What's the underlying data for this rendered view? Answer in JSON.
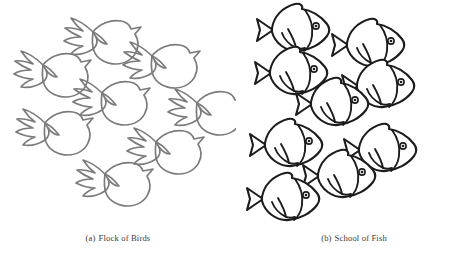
{
  "figure": {
    "background_color": "#ffffff",
    "width": 472,
    "height": 262
  },
  "panels": [
    {
      "id": "birds",
      "caption_label": "(a)",
      "caption_text": "Flock of Birds",
      "caption_full": "(a)  Flock of Birds",
      "subject": "bird",
      "subject_plural": "birds",
      "count": 8,
      "outline_color": "#7b7b7b",
      "fill_color": "#ffffff",
      "stroke_width": 1.7,
      "facing": "right",
      "arrangement": "scattered flock",
      "shapes": [
        {
          "name": "bird-1",
          "x": 97,
          "y": 40,
          "scale": 1.0
        },
        {
          "name": "bird-2",
          "x": 47,
          "y": 73,
          "scale": 1.0
        },
        {
          "name": "bird-3",
          "x": 156,
          "y": 64,
          "scale": 1.0
        },
        {
          "name": "bird-4",
          "x": 106,
          "y": 101,
          "scale": 1.0
        },
        {
          "name": "bird-5",
          "x": 201,
          "y": 111,
          "scale": 1.0
        },
        {
          "name": "bird-6",
          "x": 49,
          "y": 131,
          "scale": 1.0
        },
        {
          "name": "bird-7",
          "x": 160,
          "y": 150,
          "scale": 1.0
        },
        {
          "name": "bird-8",
          "x": 109,
          "y": 182,
          "scale": 1.0
        }
      ]
    },
    {
      "id": "fish",
      "caption_label": "(b)",
      "caption_text": "School of Fish",
      "caption_full": "(b)  School of Fish",
      "subject": "fish",
      "subject_plural": "fish",
      "count": 10,
      "outline_color": "#1c1c1c",
      "fill_color": "#ffffff",
      "stroke_width": 2.1,
      "facing": "right",
      "arrangement": "ordered school",
      "shapes": [
        {
          "name": "fish-1",
          "x": 61,
          "y": 30,
          "scale": 1.0
        },
        {
          "name": "fish-2",
          "x": 136,
          "y": 45,
          "scale": 1.0
        },
        {
          "name": "fish-3",
          "x": 59,
          "y": 73,
          "scale": 1.0
        },
        {
          "name": "fish-4",
          "x": 146,
          "y": 86,
          "scale": 1.0
        },
        {
          "name": "fish-5",
          "x": 100,
          "y": 104,
          "scale": 1.0
        },
        {
          "name": "fish-6",
          "x": 54,
          "y": 145,
          "scale": 1.0
        },
        {
          "name": "fish-7",
          "x": 148,
          "y": 150,
          "scale": 1.0
        },
        {
          "name": "fish-8",
          "x": 107,
          "y": 176,
          "scale": 1.0
        },
        {
          "name": "fish-9",
          "x": 51,
          "y": 199,
          "scale": 1.0
        },
        {
          "name": "fish-10",
          "x": 124,
          "y": 123,
          "scale": 0.0
        }
      ]
    }
  ]
}
